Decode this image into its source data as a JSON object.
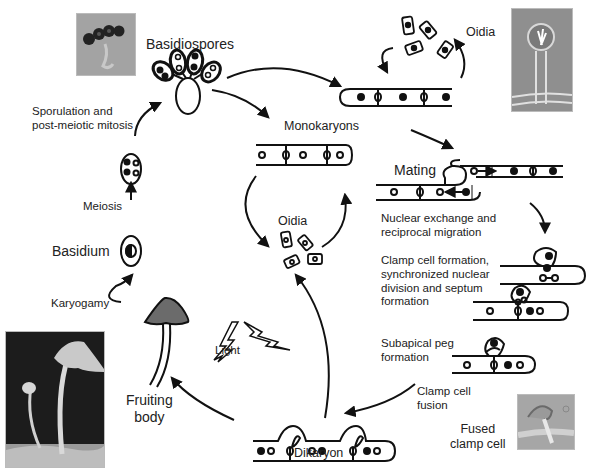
{
  "diagram": {
    "labels": {
      "basidiospores": "Basidiospores",
      "sporulation": "Sporulation and\npost-meiotic mitosis",
      "meiosis": "Meiosis",
      "basidium": "Basidium",
      "karyogamy": "Karyogamy",
      "fruiting_body": "Fruiting\nbody",
      "light": "Light",
      "dikaryon": "Dikaryon",
      "monokaryons": "Monokaryons",
      "oidia_center": "Oidia",
      "oidia_top": "Oidia",
      "mating": "Mating",
      "nuclear_exchange": "Nuclear exchange and\nreciprocal migration",
      "clamp_formation": "Clamp cell formation,\nsynchronized nuclear\ndivision and septum\nformation",
      "subapical_peg": "Subapical peg\nformation",
      "clamp_fusion": "Clamp cell\nfusion",
      "fused_clamp": "Fused\nclamp cell"
    },
    "photos": {
      "spores": "basidiospores-micrograph",
      "oidiophore": "oidiophore-micrograph",
      "mushroom": "fruiting-body-photo",
      "clamp": "fused-clamp-micrograph"
    },
    "colors": {
      "ink": "#111111",
      "cap": "#6b6b6b",
      "photo_gray": "#9a9a9a",
      "photo_dark": "#1a1a1a"
    }
  }
}
